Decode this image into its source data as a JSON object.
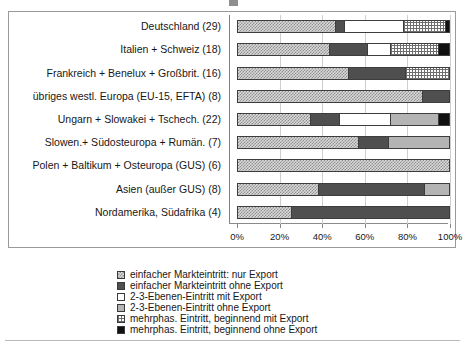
{
  "chart_data": {
    "type": "bar",
    "orientation": "horizontal",
    "stacked": true,
    "normalized": true,
    "title": "",
    "xlabel": "",
    "ylabel": "",
    "xlim": [
      0,
      100
    ],
    "xticks": [
      0,
      20,
      40,
      60,
      80,
      100
    ],
    "xticklabels": [
      "0%",
      "20%",
      "40%",
      "60%",
      "80%",
      "100%"
    ],
    "grid": true,
    "legend_position": "bottom",
    "categories": [
      "Deutschland (29)",
      "Italien + Schweiz (18)",
      "Frankreich + Benelux + Großbrit. (16)",
      "übriges westl. Europa (EU-15, EFTA) (8)",
      "Ungarn + Slowakei + Tschech. (22)",
      "Slowen.+ Südosteuropa + Rumän. (7)",
      "Polen + Baltikum + Osteuropa (GUS) (6)",
      "Asien (außer GUS) (8)",
      "Nordamerika, Südafrika (4)"
    ],
    "series": [
      {
        "name": "einfacher Markteintritt: nur Export",
        "pattern": "checker-light",
        "values": [
          46,
          43,
          52,
          87,
          34,
          57,
          100,
          38,
          25
        ]
      },
      {
        "name": "einfacher Markteintritt ohne Export",
        "pattern": "solid-dark",
        "values": [
          4,
          18,
          27,
          13,
          14,
          14,
          0,
          50,
          75
        ]
      },
      {
        "name": "2-3-Ebenen-Eintritt mit Export",
        "pattern": "white",
        "values": [
          28,
          11,
          0,
          0,
          24,
          0,
          0,
          0,
          0
        ]
      },
      {
        "name": "2-3-Ebenen-Eintritt ohne Export",
        "pattern": "light-grey",
        "values": [
          0,
          0,
          0,
          0,
          23,
          29,
          0,
          12,
          0
        ]
      },
      {
        "name": "mehrphas. Eintritt, beginnend mit Export",
        "pattern": "grid",
        "values": [
          20,
          23,
          21,
          0,
          0,
          0,
          0,
          0,
          0
        ]
      },
      {
        "name": "mehrphas. Eintritt, beginnend ohne Export",
        "pattern": "black",
        "values": [
          2,
          5,
          0,
          0,
          5,
          0,
          0,
          0,
          0
        ]
      }
    ]
  },
  "legend": {
    "items": [
      "einfacher Markteintritt: nur Export",
      "einfacher Markteintritt ohne Export",
      "2-3-Ebenen-Eintritt mit Export",
      "2-3-Ebenen-Eintritt ohne Export",
      "mehrphas. Eintritt, beginnend mit Export",
      "mehrphas. Eintritt, beginnend ohne Export"
    ]
  }
}
